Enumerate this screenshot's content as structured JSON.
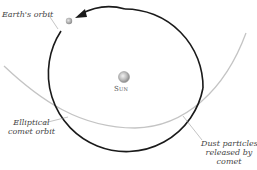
{
  "diagram": {
    "labels": {
      "earth_orbit": "Earth's orbit",
      "sun": "Sun",
      "comet_orbit_line1": "Elliptical",
      "comet_orbit_line2": "comet orbit",
      "dust_line1": "Dust particles",
      "dust_line2": "released by",
      "dust_line3": "comet"
    },
    "colors": {
      "earth_orbit": "#1a1a1a",
      "comet_orbit": "#bdbdbd",
      "sun": "#b5b5b5",
      "earth": "#a8a8a8",
      "leader": "#888888"
    }
  }
}
